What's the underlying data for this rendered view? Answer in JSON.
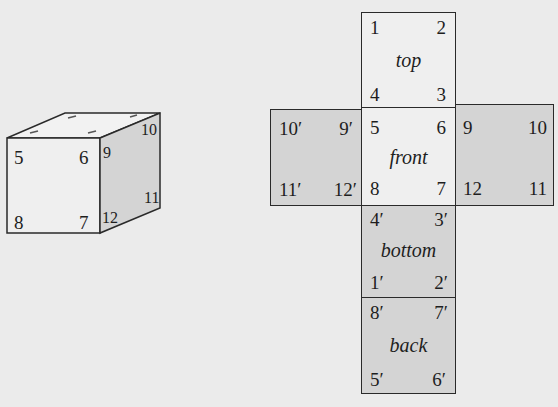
{
  "cube_3d": {
    "front_face": {
      "tl": "5",
      "tr": "6",
      "bl": "8",
      "br": "7"
    },
    "right_face": {
      "tl": "9",
      "tr": "10",
      "bl": "12",
      "br": "11"
    }
  },
  "net": {
    "top": {
      "label": "top",
      "tl": "1",
      "tr": "2",
      "bl": "4",
      "br": "3"
    },
    "left": {
      "tl": "10′",
      "tr": "9′",
      "bl": "11′",
      "br": "12′"
    },
    "front": {
      "label": "front",
      "tl": "5",
      "tr": "6",
      "bl": "8",
      "br": "7"
    },
    "right": {
      "tl": "9",
      "tr": "10",
      "bl": "12",
      "br": "11"
    },
    "bottom": {
      "label": "bottom",
      "tl": "4′",
      "tr": "3′",
      "bl": "1′",
      "br": "2′"
    },
    "back": {
      "label": "back",
      "tl": "8′",
      "tr": "7′",
      "bl": "5′",
      "br": "6′"
    }
  },
  "colors": {
    "light_face": "#efefef",
    "dark_face": "#d4d4d4",
    "line": "#2a2a2a"
  }
}
